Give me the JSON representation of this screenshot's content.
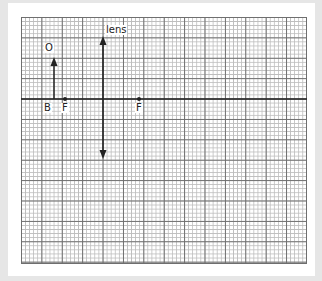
{
  "diagram": {
    "type": "ray diagram (converging lens)",
    "labels": {
      "lens": "lens",
      "object": "O",
      "object_base": "B",
      "focal_left": "F",
      "focal_right": "F"
    },
    "elements": {
      "principal_axis": {
        "y": 99,
        "x_start": 21,
        "x_end": 307
      },
      "lens": {
        "x": 103,
        "y_top": 37,
        "y_bottom": 158,
        "arrows": "both ends"
      },
      "object_arrow": {
        "x": 54,
        "y_base": 99,
        "y_tip": 58
      },
      "focal_points": [
        {
          "x": 65,
          "y": 99
        },
        {
          "x": 139,
          "y": 99
        }
      ]
    },
    "grid": {
      "minor_square_px": 4.08,
      "major_square_px": 20.4,
      "minor_per_major": 5
    }
  },
  "colors": {
    "background": "#e6e6e6",
    "panel": "#ffffff",
    "major_grid": "#6e6e6e",
    "minor_grid": "#bdbdbd",
    "ink": "#222222"
  }
}
